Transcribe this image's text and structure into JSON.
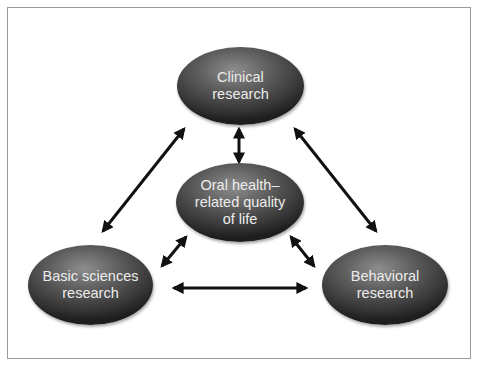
{
  "diagram": {
    "nodes": [
      {
        "id": "clinical",
        "label": "Clinical\nresearch"
      },
      {
        "id": "oral",
        "label": "Oral health–\nrelated quality\nof life"
      },
      {
        "id": "basic",
        "label": "Basic sciences\nresearch"
      },
      {
        "id": "behavioral",
        "label": "Behavioral\nresearch"
      }
    ],
    "edges": [
      {
        "from": "clinical",
        "to": "oral",
        "type": "bidirectional"
      },
      {
        "from": "clinical",
        "to": "basic",
        "type": "bidirectional"
      },
      {
        "from": "clinical",
        "to": "behavioral",
        "type": "bidirectional"
      },
      {
        "from": "oral",
        "to": "basic",
        "type": "bidirectional"
      },
      {
        "from": "oral",
        "to": "behavioral",
        "type": "bidirectional"
      },
      {
        "from": "basic",
        "to": "behavioral",
        "type": "bidirectional"
      }
    ],
    "colors": {
      "node_fill": "#4a4a4a",
      "node_text": "#ececec",
      "arrow": "#111111",
      "frame": "#9a9a9a"
    }
  }
}
